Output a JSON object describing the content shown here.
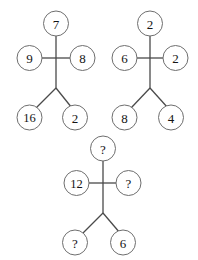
{
  "figure": {
    "type": "number-puzzle-diagram",
    "background_color": "#ffffff",
    "node_fill_color": "#ffffff",
    "node_stroke_color": "#6e6e6e",
    "connector_color": "#4a4a4a",
    "text_color": "#141414",
    "unknown_marker": "?"
  },
  "diagrams": [
    {
      "name": "diagram-1",
      "nodes": {
        "top": "7",
        "left": "9",
        "right": "8",
        "bottom_left": "16",
        "bottom_right": "2"
      }
    },
    {
      "name": "diagram-2",
      "nodes": {
        "top": "2",
        "left": "6",
        "right": "2",
        "bottom_left": "8",
        "bottom_right": "4"
      }
    },
    {
      "name": "diagram-3",
      "nodes": {
        "top": "?",
        "left": "12",
        "right": "?",
        "bottom_left": "?",
        "bottom_right": "6"
      }
    }
  ]
}
